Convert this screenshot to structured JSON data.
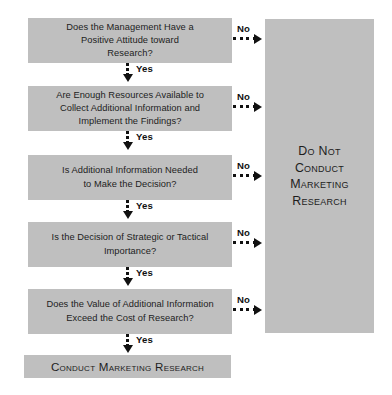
{
  "diagram": {
    "colors": {
      "node_fill": "#bfbfbf",
      "text": "#1d1d1d",
      "connector": "#111111",
      "background": "#ffffff"
    },
    "nodes": [
      {
        "id": "management-attitude",
        "text": "Does the Management Have a\nPositive Attitude toward\nResearch?"
      },
      {
        "id": "enough-resources",
        "text": "Are Enough Resources Available to\nCollect Additional Information and\nImplement the Findings?"
      },
      {
        "id": "additional-information-needed",
        "text": "Is Additional Information Needed\nto Make the Decision?"
      },
      {
        "id": "strategic-or-tactical",
        "text": "Is the Decision of Strategic or Tactical\nImportance?"
      },
      {
        "id": "value-exceeds-cost",
        "text": "Does the Value of Additional Information\nExceed the Cost of Research?"
      }
    ],
    "terminal": {
      "id": "conduct-marketing-research",
      "text": "Conduct Marketing Research"
    },
    "panel": {
      "id": "do-not-conduct-marketing-research",
      "text": "Do Not\nConduct\nMarketing\nResearch"
    },
    "edges": {
      "yes_label": "Yes",
      "no_label": "No",
      "yes": [
        {
          "from": "management-attitude",
          "to": "enough-resources",
          "label": "Yes"
        },
        {
          "from": "enough-resources",
          "to": "additional-information-needed",
          "label": "Yes"
        },
        {
          "from": "additional-information-needed",
          "to": "strategic-or-tactical",
          "label": "Yes"
        },
        {
          "from": "strategic-or-tactical",
          "to": "value-exceeds-cost",
          "label": "Yes"
        },
        {
          "from": "value-exceeds-cost",
          "to": "conduct-marketing-research",
          "label": "Yes"
        }
      ],
      "no": [
        {
          "from": "management-attitude",
          "to": "do-not-conduct-marketing-research",
          "label": "No"
        },
        {
          "from": "enough-resources",
          "to": "do-not-conduct-marketing-research",
          "label": "No"
        },
        {
          "from": "additional-information-needed",
          "to": "do-not-conduct-marketing-research",
          "label": "No"
        },
        {
          "from": "strategic-or-tactical",
          "to": "do-not-conduct-marketing-research",
          "label": "No"
        },
        {
          "from": "value-exceeds-cost",
          "to": "do-not-conduct-marketing-research",
          "label": "No"
        }
      ]
    }
  }
}
